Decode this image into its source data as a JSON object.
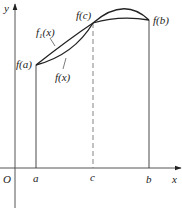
{
  "figure": {
    "axes": {
      "x_label": "x",
      "y_label": "y",
      "origin_label": "O"
    },
    "points": {
      "a_label": "a",
      "b_label": "b",
      "c_label": "c"
    },
    "value_labels": {
      "fa": "f(a)",
      "fb": "f(b)",
      "fc": "f(c)"
    },
    "curves": {
      "f1_label": "f",
      "f1_subscript": "1",
      "f1_arg": "(x)",
      "f_label": "f(x)"
    },
    "colors": {
      "stroke": "#222222",
      "axis": "#555555",
      "dashed": "#777777"
    }
  }
}
